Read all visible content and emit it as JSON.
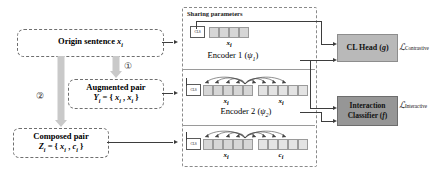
{
  "diagram": {
    "left_flow": {
      "origin": {
        "label": "Origin sentence",
        "var": "x",
        "sub": "i"
      },
      "augmented": {
        "label": "Augmented pair",
        "formula_lhs": "Y",
        "formula_lhs_sub": "i",
        "formula": "= { xᵢ , xᵢ }",
        "pair_left": "x",
        "pair_right": "x",
        "pair_sub": "i"
      },
      "composed": {
        "label": "Composed pair",
        "formula_lhs": "Z",
        "formula_lhs_sub": "i",
        "formula": "= { xᵢ , cᵢ }",
        "pair_left": "x",
        "pair_right": "c",
        "pair_sub": "i"
      },
      "step_one": "①",
      "step_two": "②"
    },
    "sharing": {
      "label": "Sharing parameters"
    },
    "encoder1": {
      "name": "Encoder 1",
      "param": "ψ",
      "param_sub": "1",
      "cls_token": "CLS",
      "token_caption": "x",
      "token_caption_sub": "i",
      "token_count": 4
    },
    "encoder2": {
      "name": "Encoder 2",
      "param": "ψ",
      "param_sub": "2",
      "cls_token": "CLS",
      "row_a_left_caption": "x",
      "row_a_right_caption": "x",
      "row_b_left_caption": "x",
      "row_b_right_caption": "c",
      "caption_sub": "i",
      "tokens_per_group": 5
    },
    "heads": {
      "cl_head": {
        "label": "CL Head",
        "param": "g"
      },
      "interaction": {
        "label_line1": "Interaction",
        "label_line2": "Classifier",
        "param": "f"
      }
    },
    "losses": {
      "contrastive": {
        "symbol": "ℒ",
        "sub": "Contrastive"
      },
      "interactive": {
        "symbol": "ℒ",
        "sub": "Interactive"
      }
    },
    "colors": {
      "token_fill": "#d6d6d6",
      "head_fill": "#b9b9b9",
      "classifier_fill": "#969696",
      "block_arrow": "#c9c9c9",
      "line": "#3d3d3d",
      "dashed_border": "#6f6f6f"
    }
  }
}
